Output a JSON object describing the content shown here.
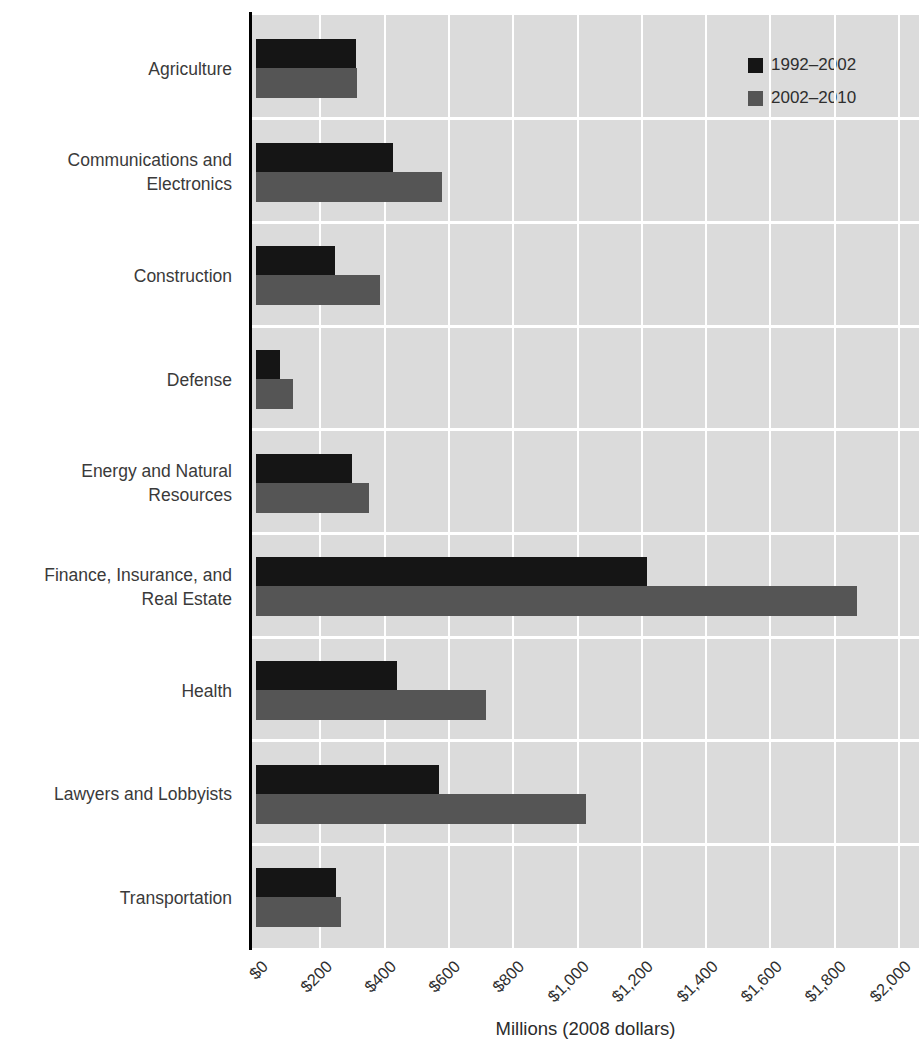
{
  "chart_data": {
    "type": "bar",
    "orientation": "horizontal",
    "title": "",
    "xlabel": "Millions (2008 dollars)",
    "ylabel": "",
    "xlim": [
      0,
      2060
    ],
    "grid": true,
    "plot_bg_color": "#dbdbdb",
    "gridline_color": "#ffffff",
    "axis_color": "#000000",
    "legend_position": "top-right",
    "categories": [
      "Agriculture",
      "Communications and\nElectronics",
      "Construction",
      "Defense",
      "Energy and Natural\nResources",
      "Finance, Insurance, and\nReal Estate",
      "Health",
      "Lawyers and Lobbyists",
      "Transportation"
    ],
    "series": [
      {
        "name": "1992–2002",
        "color": "#151515",
        "values": [
          310,
          425,
          245,
          75,
          300,
          1215,
          440,
          570,
          250
        ]
      },
      {
        "name": "2002–2010",
        "color": "#555555",
        "values": [
          315,
          580,
          385,
          115,
          350,
          1870,
          715,
          1025,
          265
        ]
      }
    ],
    "x_ticks": [
      "$0",
      "$200",
      "$400",
      "$600",
      "$800",
      "$1,000",
      "$1,200",
      "$1,400",
      "$1,600",
      "$1,800",
      "$2,000"
    ],
    "x_tick_values": [
      0,
      200,
      400,
      600,
      800,
      1000,
      1200,
      1400,
      1600,
      1800,
      2000
    ]
  }
}
